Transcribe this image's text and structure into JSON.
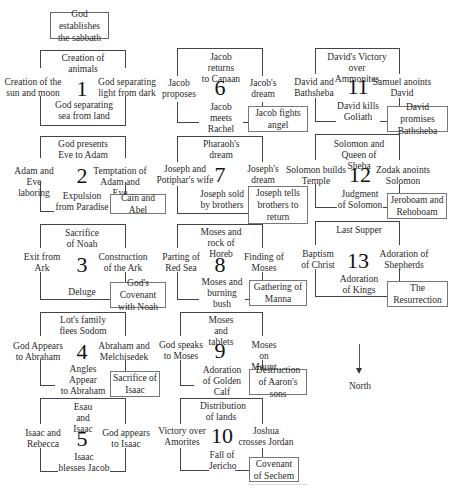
{
  "title_box": "God establishes\nthe sabbath",
  "north": {
    "label": "North"
  },
  "panels": [
    {
      "number": "1",
      "top": "Creation of\nanimals",
      "left": "Creation of the\nsun and moon",
      "right": "God separating\nlight from dark",
      "bottom": "God separating\nsea from land",
      "extra": ""
    },
    {
      "number": "2",
      "top": "God presents\nEve to Adam",
      "left": "Adam and Eve\nlaboring",
      "right": "Temptation of\nAdam and Eve",
      "bottom": "Expulsion\nfrom Paradise",
      "extra": "Cain and Abel"
    },
    {
      "number": "3",
      "top": "Sacrifice\nof Noah",
      "left": "Exit from\nArk",
      "right": "Construction\nof the Ark",
      "bottom": "Deluge",
      "extra": "God's Covenant\nwith Noah"
    },
    {
      "number": "4",
      "top": "Lot's family\nflees Sodom",
      "left": "God Appears\nto Abraham",
      "right": "Abraham and\nMelchisedek",
      "bottom": "Angles Appear\nto Abraham",
      "extra": "Sacrifice of\nIsaac"
    },
    {
      "number": "5",
      "top": "Esau and\nIsaac",
      "left": "Isaac and\nRebecca",
      "right": "God appears\nto Isaac",
      "bottom": "Isaac\nblesses Jacob",
      "extra": ""
    },
    {
      "number": "6",
      "top": "Jacob returns\nto Canaan",
      "left": "Jacob\nproposes",
      "right": "Jacob's\ndream",
      "bottom": "Jacob meets\nRachel",
      "extra": "Jacob fights\nangel"
    },
    {
      "number": "7",
      "top": "Pharaoh's\ndream",
      "left": "Joseph and\nPotiphar's wife",
      "right": "Joseph's\ndream",
      "bottom": "Joseph sold\nby  brothers",
      "extra": "Joseph tells\nbrothers to\nreturn"
    },
    {
      "number": "8",
      "top": "Moses and\nrock of Horeb",
      "left": "Parting of\nRed Sea",
      "right": "Finding of\nMoses",
      "bottom": "Moses and\nburning bush",
      "extra": "Gathering of\nManna"
    },
    {
      "number": "9",
      "top": "Moses and\ntablets",
      "left": "God speaks\nto Moses",
      "right": "Moses on\nMount",
      "bottom": "Adoration\nof Golden Calf",
      "extra": "Destruction\nof Aaron's sons"
    },
    {
      "number": "10",
      "top": "Distribution\nof lands",
      "left": "Victory over\nAmorites",
      "right": "Joshua\ncrosses Jordan",
      "bottom": "Fall of\nJericho",
      "extra": "Covenant\nof Sechem"
    },
    {
      "number": "11",
      "top": "David's Victory\nover Ammonites",
      "left": "David and\nBathsheba",
      "right": "Samuel anoints\nDavid",
      "bottom": "David kills\nGoliath",
      "extra": "David promises\nBathsheba"
    },
    {
      "number": "12",
      "top": "Solomon and\nQueen of Sheba",
      "left": "Solomon builds\nTemple",
      "right": "Zodak anoints\nSolomon",
      "bottom": "Judgment\nof Solomon",
      "extra": "Jeroboam and\nRehoboam"
    },
    {
      "number": "13",
      "top": "Last Supper",
      "left": "Baptism\nof Christ",
      "right": "Adoration of\nShepherds",
      "bottom": "Adoration\nof Kings",
      "extra": "The\nResurrection"
    }
  ]
}
